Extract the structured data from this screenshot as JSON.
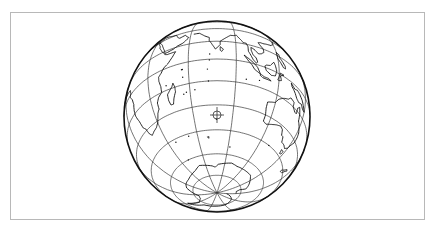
{
  "map": {
    "projection": "orthographic",
    "center": {
      "lon": 78,
      "lat": -37
    },
    "graticule": {
      "meridian_step_deg": 30,
      "parallel_step_deg": 15
    },
    "viewport": {
      "cx": 217,
      "cy": 116.5,
      "rx": 93,
      "ry": 95.5
    },
    "colors": {
      "background": "#ffffff",
      "frame": "#b8b8b8",
      "lines": "#3a3a3a",
      "coast": "#111111"
    },
    "center_marker": {
      "type": "crosshair-circle",
      "x": 217,
      "y": 115,
      "r": 4
    },
    "features": {
      "africa": [
        [
          -17,
          21
        ],
        [
          -16,
          15
        ],
        [
          -12,
          9
        ],
        [
          -8,
          5
        ],
        [
          -3,
          5
        ],
        [
          5,
          5
        ],
        [
          9,
          4
        ],
        [
          10,
          1
        ],
        [
          9,
          -1
        ],
        [
          12,
          -5
        ],
        [
          13,
          -9
        ],
        [
          12,
          -13
        ],
        [
          12,
          -17
        ],
        [
          14,
          -22
        ],
        [
          15,
          -27
        ],
        [
          17,
          -29
        ],
        [
          18,
          -33
        ],
        [
          20,
          -35
        ],
        [
          23,
          -34
        ],
        [
          27,
          -33
        ],
        [
          30,
          -31
        ],
        [
          32,
          -28
        ],
        [
          33,
          -26
        ],
        [
          35,
          -24
        ],
        [
          35,
          -20
        ],
        [
          37,
          -17
        ],
        [
          40,
          -15
        ],
        [
          40,
          -11
        ],
        [
          39,
          -7
        ],
        [
          39,
          -4
        ],
        [
          41,
          -2
        ],
        [
          43,
          1
        ],
        [
          46,
          3
        ],
        [
          49,
          7
        ],
        [
          51,
          11
        ],
        [
          48,
          11
        ],
        [
          45,
          11
        ],
        [
          43,
          12
        ],
        [
          42,
          14
        ],
        [
          40,
          16
        ],
        [
          39,
          18
        ],
        [
          37,
          21
        ],
        [
          36,
          24
        ],
        [
          34,
          27
        ],
        [
          33,
          30
        ],
        [
          32,
          31
        ],
        [
          29,
          31
        ],
        [
          25,
          32
        ],
        [
          20,
          32
        ],
        [
          15,
          33
        ],
        [
          10,
          37
        ],
        [
          5,
          37
        ],
        [
          0,
          36
        ],
        [
          -5,
          36
        ],
        [
          -9,
          33
        ],
        [
          -13,
          28
        ],
        [
          -17,
          21
        ]
      ],
      "madagascar": [
        [
          49,
          -12
        ],
        [
          50,
          -15
        ],
        [
          50,
          -18
        ],
        [
          48,
          -22
        ],
        [
          47,
          -25
        ],
        [
          45,
          -25
        ],
        [
          44,
          -22
        ],
        [
          44,
          -18
        ],
        [
          46,
          -16
        ],
        [
          48,
          -14
        ],
        [
          49,
          -12
        ]
      ],
      "arabia": [
        [
          33,
          30
        ],
        [
          35,
          28
        ],
        [
          38,
          24
        ],
        [
          40,
          20
        ],
        [
          42,
          16
        ],
        [
          43,
          13
        ],
        [
          45,
          13
        ],
        [
          49,
          14
        ],
        [
          52,
          16
        ],
        [
          55,
          17
        ],
        [
          57,
          19
        ],
        [
          59,
          22
        ],
        [
          57,
          24
        ],
        [
          56,
          26
        ],
        [
          52,
          24
        ],
        [
          50,
          26
        ],
        [
          49,
          28
        ],
        [
          48,
          30
        ],
        [
          44,
          31
        ],
        [
          40,
          33
        ],
        [
          36,
          34
        ],
        [
          33,
          30
        ]
      ],
      "india": [
        [
          62,
          25
        ],
        [
          66,
          25
        ],
        [
          68,
          23
        ],
        [
          70,
          21
        ],
        [
          73,
          19
        ],
        [
          73,
          16
        ],
        [
          75,
          12
        ],
        [
          77,
          8
        ],
        [
          78,
          9
        ],
        [
          80,
          12
        ],
        [
          80,
          15
        ],
        [
          82,
          17
        ],
        [
          85,
          20
        ],
        [
          87,
          22
        ],
        [
          89,
          22
        ],
        [
          91,
          23
        ],
        [
          92,
          21
        ],
        [
          94,
          18
        ],
        [
          95,
          16
        ],
        [
          97,
          16
        ],
        [
          98,
          13
        ],
        [
          98,
          9
        ],
        [
          99,
          7
        ],
        [
          101,
          3
        ],
        [
          103,
          1
        ],
        [
          104,
          2
        ],
        [
          103,
          5
        ],
        [
          101,
          7
        ],
        [
          100,
          10
        ],
        [
          100,
          13
        ],
        [
          102,
          12
        ],
        [
          105,
          9
        ],
        [
          107,
          10
        ],
        [
          109,
          12
        ],
        [
          109,
          15
        ],
        [
          107,
          18
        ],
        [
          106,
          20
        ],
        [
          108,
          21
        ],
        [
          110,
          21
        ],
        [
          113,
          22
        ],
        [
          117,
          23
        ],
        [
          120,
          26
        ],
        [
          121,
          29
        ],
        [
          122,
          31
        ]
      ],
      "srilanka": [
        [
          80,
          10
        ],
        [
          82,
          8
        ],
        [
          81,
          6
        ],
        [
          80,
          7
        ],
        [
          80,
          10
        ]
      ],
      "sumatra": [
        [
          95,
          5
        ],
        [
          98,
          3
        ],
        [
          102,
          0
        ],
        [
          104,
          -2
        ],
        [
          106,
          -6
        ],
        [
          104,
          -5
        ],
        [
          102,
          -4
        ],
        [
          100,
          -1
        ],
        [
          98,
          1
        ],
        [
          95,
          5
        ]
      ],
      "java": [
        [
          106,
          -6
        ],
        [
          109,
          -7
        ],
        [
          112,
          -7
        ],
        [
          114,
          -8
        ],
        [
          111,
          -8
        ],
        [
          108,
          -8
        ],
        [
          106,
          -7
        ],
        [
          106,
          -6
        ]
      ],
      "borneo": [
        [
          109,
          1
        ],
        [
          110,
          -2
        ],
        [
          114,
          -4
        ],
        [
          117,
          -3
        ],
        [
          118,
          1
        ],
        [
          117,
          5
        ],
        [
          116,
          7
        ],
        [
          113,
          3
        ],
        [
          110,
          2
        ],
        [
          109,
          1
        ]
      ],
      "sulawesi": [
        [
          119,
          -5
        ],
        [
          120,
          -2
        ],
        [
          121,
          1
        ],
        [
          124,
          1
        ],
        [
          121,
          -1
        ],
        [
          122,
          -4
        ],
        [
          120,
          -5
        ],
        [
          119,
          -5
        ]
      ],
      "newguinea": [
        [
          131,
          -1
        ],
        [
          135,
          -3
        ],
        [
          138,
          -2
        ],
        [
          141,
          -3
        ],
        [
          145,
          -5
        ],
        [
          147,
          -7
        ],
        [
          150,
          -10
        ],
        [
          147,
          -10
        ],
        [
          144,
          -8
        ],
        [
          141,
          -9
        ],
        [
          138,
          -8
        ],
        [
          135,
          -5
        ],
        [
          132,
          -3
        ],
        [
          131,
          -1
        ]
      ],
      "philippines": [
        [
          120,
          18
        ],
        [
          122,
          17
        ],
        [
          122,
          14
        ],
        [
          124,
          12
        ],
        [
          126,
          9
        ],
        [
          126,
          7
        ],
        [
          124,
          7
        ],
        [
          122,
          10
        ],
        [
          120,
          12
        ],
        [
          120,
          15
        ],
        [
          120,
          18
        ]
      ],
      "australia": [
        [
          114,
          -22
        ],
        [
          114,
          -26
        ],
        [
          115,
          -30
        ],
        [
          115,
          -34
        ],
        [
          118,
          -35
        ],
        [
          121,
          -34
        ],
        [
          124,
          -33
        ],
        [
          127,
          -32
        ],
        [
          131,
          -31
        ],
        [
          134,
          -32
        ],
        [
          136,
          -35
        ],
        [
          138,
          -35
        ],
        [
          140,
          -38
        ],
        [
          144,
          -38
        ],
        [
          147,
          -39
        ],
        [
          150,
          -37
        ],
        [
          151,
          -34
        ],
        [
          153,
          -31
        ],
        [
          153,
          -27
        ],
        [
          152,
          -24
        ],
        [
          149,
          -21
        ],
        [
          146,
          -19
        ],
        [
          145,
          -15
        ],
        [
          143,
          -11
        ],
        [
          141,
          -13
        ],
        [
          141,
          -17
        ],
        [
          139,
          -17
        ],
        [
          136,
          -15
        ],
        [
          136,
          -12
        ],
        [
          132,
          -11
        ],
        [
          130,
          -13
        ],
        [
          127,
          -14
        ],
        [
          125,
          -15
        ],
        [
          122,
          -17
        ],
        [
          120,
          -20
        ],
        [
          117,
          -21
        ],
        [
          114,
          -22
        ]
      ],
      "tasmania": [
        [
          145,
          -41
        ],
        [
          148,
          -41
        ],
        [
          148,
          -43
        ],
        [
          146,
          -43.5
        ],
        [
          145,
          -41
        ]
      ],
      "newzealand_s": [
        [
          166,
          -46
        ],
        [
          169,
          -44
        ],
        [
          172,
          -41
        ],
        [
          174,
          -41
        ],
        [
          172,
          -43
        ],
        [
          170,
          -46
        ],
        [
          167,
          -47
        ],
        [
          166,
          -46
        ]
      ],
      "antarctica": [
        [
          -180,
          -84
        ],
        [
          -150,
          -78
        ],
        [
          -120,
          -74
        ],
        [
          -100,
          -73
        ],
        [
          -75,
          -72
        ],
        [
          -65,
          -66
        ],
        [
          -58,
          -63
        ],
        [
          -60,
          -68
        ],
        [
          -62,
          -73
        ],
        [
          -50,
          -77
        ],
        [
          -35,
          -78
        ],
        [
          -20,
          -74
        ],
        [
          -10,
          -71
        ],
        [
          0,
          -70
        ],
        [
          15,
          -70
        ],
        [
          30,
          -69
        ],
        [
          40,
          -68
        ],
        [
          50,
          -66
        ],
        [
          60,
          -67
        ],
        [
          70,
          -68
        ],
        [
          75,
          -69
        ],
        [
          80,
          -67
        ],
        [
          90,
          -66
        ],
        [
          100,
          -65
        ],
        [
          110,
          -66
        ],
        [
          120,
          -66
        ],
        [
          130,
          -66
        ],
        [
          140,
          -66
        ],
        [
          150,
          -68
        ],
        [
          160,
          -70
        ],
        [
          168,
          -72
        ],
        [
          165,
          -76
        ],
        [
          170,
          -78
        ],
        [
          180,
          -78
        ]
      ],
      "kerguelen": [
        [
          69,
          -49
        ],
        [
          70.5,
          -49
        ],
        [
          70,
          -50
        ],
        [
          69,
          -49
        ]
      ]
    },
    "islands": [
      [
        55.5,
        -21
      ],
      [
        57.5,
        -20.2
      ],
      [
        73.5,
        4
      ],
      [
        73.3,
        -0.5
      ],
      [
        72,
        -7
      ],
      [
        96.8,
        -12.1
      ],
      [
        105.7,
        -10.5
      ],
      [
        77.5,
        -38.7
      ],
      [
        51.8,
        -46.4
      ],
      [
        37.7,
        -46.9
      ],
      [
        63.4,
        -19.7
      ],
      [
        56,
        -4.6
      ],
      [
        55.5,
        -4.7
      ],
      [
        44,
        -12
      ],
      [
        56,
        -10
      ],
      [
        72.5,
        -15
      ],
      [
        130,
        -45
      ],
      [
        92,
        -55
      ],
      [
        40,
        -60
      ]
    ]
  }
}
